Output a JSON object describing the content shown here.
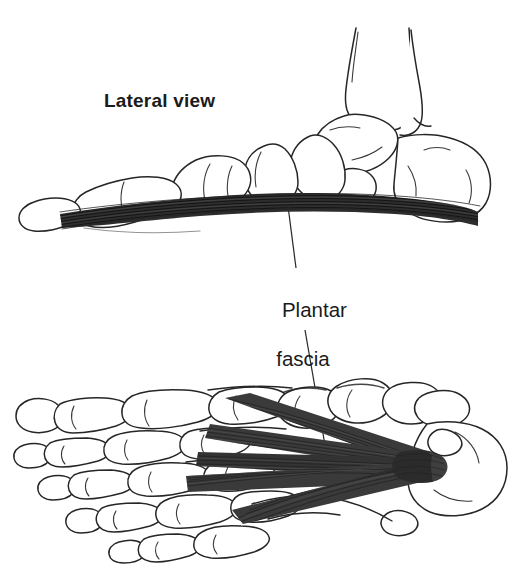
{
  "figure": {
    "background_color": "#ffffff",
    "ink_color": "#1b1b1b",
    "fascia_color": "#2a2a2a",
    "width": 523,
    "height": 573
  },
  "labels": {
    "lateral_view": "Lateral view",
    "plantar_fascia_line1": "Plantar",
    "plantar_fascia_line2": "fascia"
  },
  "panels": {
    "top": {
      "name": "lateral-view-panel",
      "caption": "Lateral view",
      "description": "Side view of foot skeleton with plantar fascia band along the sole"
    },
    "bottom": {
      "name": "plantar-view-panel",
      "caption": "",
      "description": "Inferior view of foot skeleton with plantar fascia fanning from calcaneus to toes"
    }
  },
  "leader_lines": [
    {
      "name": "leader-line-to-lateral-fascia",
      "from": [
        296,
        268
      ],
      "to": [
        288,
        206
      ]
    },
    {
      "name": "leader-line-to-plantar-fascia",
      "from": [
        305,
        330
      ],
      "to": [
        330,
        474
      ]
    }
  ],
  "structures": [
    {
      "name": "tibia",
      "view": "lateral"
    },
    {
      "name": "fibula",
      "view": "lateral"
    },
    {
      "name": "talus",
      "view": "lateral"
    },
    {
      "name": "calcaneus",
      "view": "lateral"
    },
    {
      "name": "navicular",
      "view": "lateral"
    },
    {
      "name": "cuneiforms",
      "view": "lateral"
    },
    {
      "name": "metatarsals",
      "view": "lateral"
    },
    {
      "name": "phalanges",
      "view": "lateral"
    },
    {
      "name": "plantar-fascia-band",
      "view": "lateral"
    },
    {
      "name": "calcaneus",
      "view": "plantar"
    },
    {
      "name": "metatarsals",
      "view": "plantar"
    },
    {
      "name": "phalanges",
      "view": "plantar"
    },
    {
      "name": "plantar-fascia-fan",
      "view": "plantar"
    }
  ]
}
